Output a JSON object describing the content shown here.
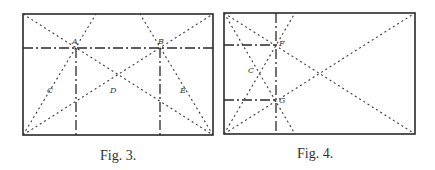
{
  "figures": [
    {
      "caption": "Fig. 3.",
      "labels": {
        "A": "A",
        "B": "B",
        "C": "C",
        "D": "D",
        "E": "E"
      }
    },
    {
      "caption": "Fig. 4.",
      "labels": {
        "F": "F",
        "G": "G",
        "C": "C"
      }
    }
  ]
}
